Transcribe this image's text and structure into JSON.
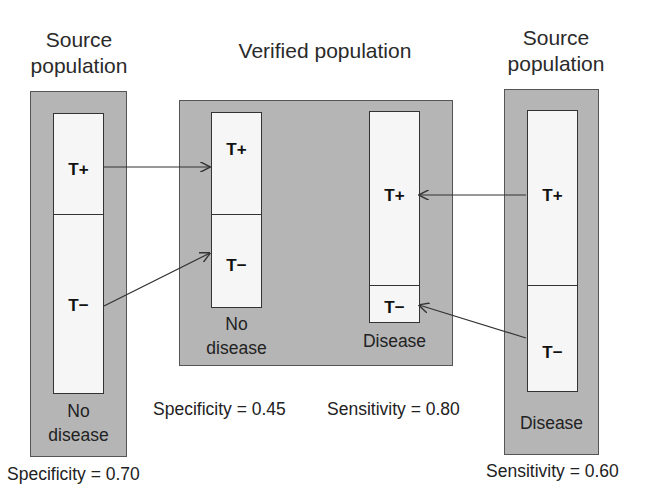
{
  "left_panel": {
    "title_line1": "Source",
    "title_line2": "population",
    "t_plus": "T+",
    "t_minus": "T−",
    "caption_line1": "No",
    "caption_line2": "disease",
    "metric": "Specificity = 0.70"
  },
  "middle_panel": {
    "title": "Verified population",
    "left_box": {
      "t_plus": "T+",
      "t_minus": "T−",
      "caption_line1": "No",
      "caption_line2": "disease"
    },
    "right_box": {
      "t_plus": "T+",
      "t_minus": "T−",
      "caption": "Disease"
    },
    "specificity": "Specificity = 0.45",
    "sensitivity": "Sensitivity = 0.80"
  },
  "right_panel": {
    "title_line1": "Source",
    "title_line2": "population",
    "t_plus": "T+",
    "t_minus": "T−",
    "caption": "Disease",
    "metric": "Sensitivity = 0.60"
  },
  "arrows": [
    {
      "from": "left T+",
      "to": "verified no-disease T+"
    },
    {
      "from": "left T−",
      "to": "verified no-disease T−"
    },
    {
      "from": "right T+",
      "to": "verified disease T+"
    },
    {
      "from": "right T−",
      "to": "verified disease T−"
    }
  ]
}
